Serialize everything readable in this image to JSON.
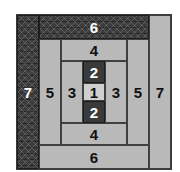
{
  "figure": {
    "colors": {
      "light_fill": "#b9b9b9",
      "pale_fill": "#cfcfcf",
      "dark_fill": "#3a3a3a",
      "hatch_fill": "#3c3c3c",
      "stroke": "#3f3f3f",
      "light_text": "#ffffff",
      "dark_text": "#111111"
    },
    "horizontal_sequence": [
      7,
      5,
      3,
      1,
      3,
      5,
      7
    ],
    "vertical_sequence": [
      6,
      4,
      2,
      1,
      2,
      4,
      6
    ],
    "cells": [
      {
        "id": "left-outer",
        "label": "7",
        "style": "hatch",
        "x": 0,
        "y": 0,
        "w": 22,
        "h": 154
      },
      {
        "id": "top-outer",
        "label": "6",
        "style": "hatch",
        "x": 22,
        "y": 0,
        "w": 110,
        "h": 24
      },
      {
        "id": "right-outer",
        "label": "7",
        "style": "light",
        "x": 132,
        "y": 0,
        "w": 22,
        "h": 154
      },
      {
        "id": "bottom-outer",
        "label": "6",
        "style": "light",
        "x": 22,
        "y": 130,
        "w": 110,
        "h": 24
      },
      {
        "id": "left-mid",
        "label": "5",
        "style": "light",
        "x": 22,
        "y": 24,
        "w": 22,
        "h": 106
      },
      {
        "id": "top-mid",
        "label": "4",
        "style": "light",
        "x": 44,
        "y": 24,
        "w": 66,
        "h": 22
      },
      {
        "id": "right-mid",
        "label": "5",
        "style": "light",
        "x": 110,
        "y": 24,
        "w": 22,
        "h": 106
      },
      {
        "id": "bottom-mid",
        "label": "4",
        "style": "light",
        "x": 44,
        "y": 108,
        "w": 66,
        "h": 22
      },
      {
        "id": "left-inner",
        "label": "3",
        "style": "light",
        "x": 44,
        "y": 46,
        "w": 22,
        "h": 62
      },
      {
        "id": "top-inner",
        "label": "2",
        "style": "dark",
        "x": 66,
        "y": 46,
        "w": 22,
        "h": 22
      },
      {
        "id": "right-inner",
        "label": "3",
        "style": "light",
        "x": 88,
        "y": 46,
        "w": 22,
        "h": 62
      },
      {
        "id": "bottom-inner",
        "label": "2",
        "style": "dark",
        "x": 66,
        "y": 86,
        "w": 22,
        "h": 22
      },
      {
        "id": "center",
        "label": "1",
        "style": "pale",
        "x": 66,
        "y": 68,
        "w": 22,
        "h": 18
      }
    ]
  }
}
